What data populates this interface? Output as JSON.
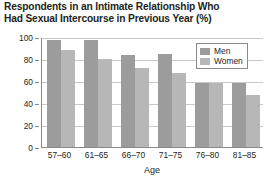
{
  "chart_data": {
    "type": "bar",
    "title": "Respondents in an Intimate Relationship Who Had Sexual Intercourse in Previous Year (%)",
    "title_lines": [
      "Respondents in an Intimate Relationship Who",
      "Had Sexual Intercourse in Previous Year (%)"
    ],
    "categories": [
      "57–60",
      "61–65",
      "66–70",
      "71–75",
      "76–80",
      "81–85"
    ],
    "series": [
      {
        "name": "Men",
        "color": "#9c9c9c",
        "values": [
          97,
          97,
          84,
          85,
          58,
          58
        ]
      },
      {
        "name": "Women",
        "color": "#b7b7b7",
        "values": [
          88,
          80,
          72,
          67,
          58,
          47
        ]
      }
    ],
    "xlabel": "Age",
    "ylabel": "",
    "ylim": [
      0,
      100
    ],
    "yticks": [
      0,
      20,
      40,
      60,
      80,
      100
    ],
    "ytick_labels": [
      "0",
      "20",
      "40",
      "60",
      "80",
      "100"
    ],
    "grid": true,
    "legend_position": "top-right-inside"
  }
}
